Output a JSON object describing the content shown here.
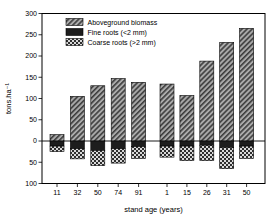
{
  "chart_data": {
    "type": "bar",
    "stacked": true,
    "title": "",
    "xlabel": "stand age (years)",
    "ylabel": "tons.ha⁻¹",
    "ylim": [
      -100,
      300
    ],
    "ytick_step": 50,
    "ytick_labels_absolute": true,
    "ytick_values": [
      300,
      250,
      200,
      150,
      100,
      50,
      0,
      -50,
      -100
    ],
    "ytick_labels": [
      "300",
      "250",
      "200",
      "150",
      "100",
      "50",
      "0",
      "50",
      "100"
    ],
    "categories": [
      "11",
      "32",
      "50",
      "74",
      "91",
      "1",
      "15",
      "26",
      "31",
      "50"
    ],
    "group_split_index": 5,
    "series": [
      {
        "name": "Aboveground biomass",
        "pattern": "diagonal-hatch",
        "values": [
          15,
          105,
          130,
          147,
          138,
          134,
          107,
          188,
          232,
          265
        ]
      },
      {
        "name": "Fine roots (<2 mm)",
        "pattern": "solid-dark",
        "values": [
          -12,
          -18,
          -22,
          -18,
          -13,
          -12,
          -12,
          -10,
          -15,
          -12
        ]
      },
      {
        "name": "Coarse roots (>2 mm)",
        "pattern": "checker",
        "values": [
          -13,
          -24,
          -36,
          -34,
          -28,
          -26,
          -34,
          -36,
          -50,
          -29
        ]
      }
    ],
    "legend": {
      "position": "top-left-inside"
    },
    "grid": "off",
    "style": {
      "background": "#ffffff",
      "frame_color": "#000000",
      "hatch_bg": "#aaaaaa",
      "hatch_line": "#3d3d3d",
      "solid_fill": "#1d1d1d",
      "checker_dark": "#2e2e2e",
      "checker_light": "#d8d8d8"
    }
  }
}
